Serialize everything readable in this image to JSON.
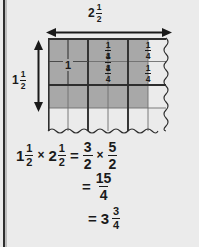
{
  "page": {
    "background_color": "#ebebeb",
    "rule_color": "#2e2e2e"
  },
  "dimensions": {
    "top": {
      "label_whole": "2",
      "label_num": "1",
      "label_den": "2",
      "arrow_name": "horizontal-double-arrow"
    },
    "left": {
      "label_whole": "1",
      "label_num": "1",
      "label_den": "2",
      "arrow_name": "vertical-double-arrow"
    }
  },
  "grid": {
    "shade_color": "#a8a8a8",
    "line_color": "#2e2e2e",
    "thin_line_color": "#7a7a7a",
    "cols": 6,
    "rows": 4,
    "shaded_cols": 5,
    "shaded_rows": 3,
    "unit_square_label": "1",
    "quarter_cells": [
      {
        "num": "1",
        "den": "4"
      },
      {
        "num": "1",
        "den": "4"
      },
      {
        "num": "1",
        "den": "4"
      },
      {
        "num": "1",
        "den": "4"
      }
    ]
  },
  "equations": {
    "line1": {
      "a_whole": "1",
      "a_num": "1",
      "a_den": "2",
      "times": "×",
      "b_whole": "2",
      "b_num": "1",
      "b_den": "2",
      "equals": "=",
      "c_num": "3",
      "c_den": "2",
      "times2": "×",
      "d_num": "5",
      "d_den": "2"
    },
    "line2": {
      "equals": "=",
      "num": "15",
      "den": "4"
    },
    "line3": {
      "equals": "=",
      "whole": "3",
      "num": "3",
      "den": "4"
    }
  }
}
